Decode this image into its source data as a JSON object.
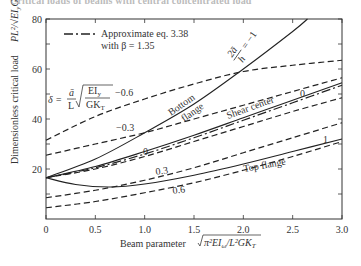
{
  "header": {
    "text": "Critical loads of beams with central concentrated load"
  },
  "chart_data": {
    "type": "line",
    "title": "",
    "xlabel": "Beam parameter √(π²EIω / L²GK_T)",
    "ylabel": "Dimensionless critical load PL²/√(EI_y GK_T)",
    "xlim": [
      0,
      3.0
    ],
    "ylim": [
      0,
      80
    ],
    "xticks": [
      "0",
      "0.5",
      "1.0",
      "1.5",
      "2.0",
      "2.5",
      "3.0"
    ],
    "yticks": [
      "20",
      "40",
      "60",
      "80"
    ],
    "grid": false,
    "legend": {
      "position": "upper-left",
      "entries": [
        {
          "style": "dash-dot",
          "label": "Approximate eq. 3.38",
          "label2": "with β = 1.35"
        }
      ]
    },
    "annotations": {
      "delta_formula": "δ = ā/L √(EI_y/GK_T) = −0.6",
      "a_over_h": "2ā/h = −1",
      "bottom_flange": "Bottom flange",
      "shear_center": "Shear center",
      "top_flange": "Top flange",
      "delta_labels": [
        "−0.6",
        "−0.3",
        "0",
        "0.3",
        "0.6"
      ],
      "a_h_labels": [
        "−1",
        "0",
        "1"
      ]
    },
    "series": [
      {
        "name": "δ = −0.6 (dashed)",
        "style": "dashed",
        "x": [
          0,
          0.5,
          1.0,
          1.5,
          2.0,
          2.5,
          3.0
        ],
        "y": [
          31.5,
          41,
          48,
          54,
          59,
          61.5,
          63.5
        ]
      },
      {
        "name": "δ = −0.3 (dashed)",
        "style": "dashed",
        "x": [
          0,
          0.5,
          1.0,
          1.5,
          2.0,
          2.5,
          3.0
        ],
        "y": [
          25.5,
          30,
          34.5,
          40,
          45.5,
          51,
          56.5
        ]
      },
      {
        "name": "δ = 0 (dashed)",
        "style": "dashed",
        "x": [
          0,
          0.5,
          1.0,
          1.5,
          2.0,
          2.5,
          3.0
        ],
        "y": [
          16.5,
          20,
          25,
          31,
          37,
          43,
          48.5
        ]
      },
      {
        "name": "δ = 0.3 (dashed)",
        "style": "dashed",
        "x": [
          0,
          0.5,
          1.0,
          1.5,
          2.0,
          2.5,
          3.0
        ],
        "y": [
          8.5,
          11.5,
          15.5,
          20.5,
          26.5,
          32.5,
          38.5
        ]
      },
      {
        "name": "δ = 0.6 (dashed)",
        "style": "dashed",
        "x": [
          0,
          0.5,
          1.0,
          1.5,
          2.0,
          2.5,
          3.0
        ],
        "y": [
          4.5,
          7,
          10.5,
          14.5,
          19.5,
          25,
          31
        ]
      },
      {
        "name": "Bottom flange 2ā/h = −1 (solid)",
        "style": "solid",
        "x": [
          0,
          0.5,
          1.0,
          1.5,
          2.0,
          2.5,
          2.65
        ],
        "y": [
          16.5,
          24,
          34.5,
          46,
          60,
          75,
          80
        ]
      },
      {
        "name": "Shear center 2ā/h = 0 (solid)",
        "style": "solid",
        "x": [
          0,
          0.5,
          1.0,
          1.5,
          2.0,
          2.5,
          3.0
        ],
        "y": [
          16.5,
          21,
          27,
          33.5,
          40.5,
          47.5,
          54.5
        ]
      },
      {
        "name": "Approximate eq. 3.38 (dash-dot)",
        "style": "dash-dot",
        "x": [
          0,
          0.5,
          1.0,
          1.5,
          2.0,
          2.5,
          3.0
        ],
        "y": [
          16.5,
          20.5,
          26,
          32.5,
          39.5,
          46.5,
          53.5
        ]
      },
      {
        "name": "Top flange 2ā/h = 1 (solid)",
        "style": "solid",
        "x": [
          0,
          0.3,
          0.65,
          1.0,
          1.5,
          2.0,
          2.5,
          3.0
        ],
        "y": [
          16.5,
          13.8,
          12.8,
          14,
          17.5,
          22,
          27,
          32
        ]
      }
    ]
  }
}
